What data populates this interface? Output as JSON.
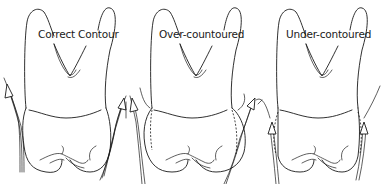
{
  "figure": {
    "panels": [
      {
        "id": "correct",
        "label": "Correct Contour"
      },
      {
        "id": "over",
        "label": "Over-countoured"
      },
      {
        "id": "under",
        "label": "Under-contoured"
      }
    ],
    "colors": {
      "line": "#1a1a1a",
      "background": "#ffffff"
    }
  }
}
